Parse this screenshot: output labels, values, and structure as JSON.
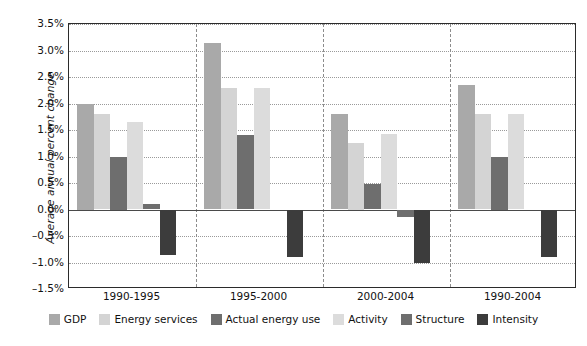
{
  "chart_data": {
    "type": "bar",
    "title": "",
    "subtitle": "",
    "xlabel": "",
    "ylabel": "Average annual percent change",
    "categories": [
      "1990-1995",
      "1995-2000",
      "2000-2004",
      "1990-2004"
    ],
    "ylim": [
      -1.5,
      3.5
    ],
    "ytick_step": 0.5,
    "ytick_labels": [
      "3.5%",
      "3.0%",
      "2.5%",
      "2.0%",
      "1.5%",
      "1.0%",
      "0.5%",
      "0.0%",
      "-0.5%",
      "-1.0%",
      "-1.5%"
    ],
    "ytick_values": [
      3.5,
      3.0,
      2.5,
      2.0,
      1.5,
      1.0,
      0.5,
      0.0,
      -0.5,
      -1.0,
      -1.5
    ],
    "grid": true,
    "grid_style": "dotted-horizontal",
    "group_dividers": true,
    "legend_position": "bottom",
    "units": "percent",
    "series": [
      {
        "name": "GDP",
        "color": "#a9a9a9",
        "values": [
          2.0,
          3.15,
          1.8,
          2.35
        ]
      },
      {
        "name": "Energy services",
        "color": "#d4d4d4",
        "values": [
          1.8,
          2.3,
          1.25,
          1.8
        ]
      },
      {
        "name": "Actual energy use",
        "color": "#6e6e6e",
        "values": [
          1.0,
          1.4,
          0.48,
          1.0
        ]
      },
      {
        "name": "Activity",
        "color": "#dcdcdc",
        "values": [
          1.65,
          2.3,
          1.43,
          1.8
        ]
      },
      {
        "name": "Structure",
        "color": "#6e6e6e",
        "values": [
          0.1,
          0.0,
          -0.15,
          0.0
        ]
      },
      {
        "name": "Intensity",
        "color": "#3c3c3c",
        "values": [
          -0.85,
          -0.9,
          -1.0,
          -0.9
        ]
      }
    ]
  },
  "axis": {
    "y_title": "Average annual percent change"
  }
}
